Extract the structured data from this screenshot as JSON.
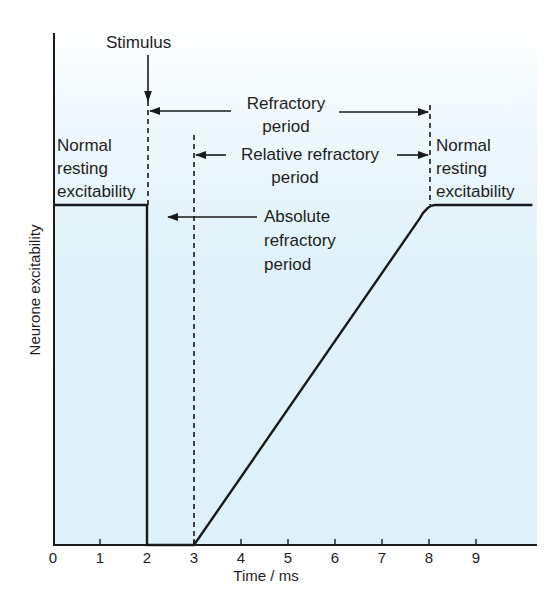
{
  "chart_data": {
    "type": "line",
    "title": "",
    "xlabel": "Time / ms",
    "ylabel": "Neurone excitability",
    "xlim": [
      0,
      10.3
    ],
    "ylim": [
      0,
      1
    ],
    "grid": false,
    "x_ticks": [
      0,
      1,
      2,
      3,
      4,
      5,
      6,
      7,
      8,
      9
    ],
    "x_tick_labels": [
      "0",
      "1",
      "2",
      "3",
      "4",
      "5",
      "6",
      "7",
      "8",
      "9"
    ],
    "y_ticks": [],
    "series": [
      {
        "name": "Neurone excitability",
        "x": [
          0,
          2,
          2,
          3,
          7.8,
          8.0,
          10.2
        ],
        "y": [
          1,
          1,
          0,
          0,
          0.96,
          1,
          1
        ]
      }
    ],
    "markers": [
      {
        "name": "stimulus",
        "x": 2,
        "style": "dashed"
      },
      {
        "name": "relative-start",
        "x": 3,
        "style": "dashed"
      },
      {
        "name": "refractory-end",
        "x": 8,
        "style": "dashed"
      }
    ],
    "annotations": [
      {
        "id": "stimulus",
        "text": "Stimulus",
        "points_to_x": 2
      },
      {
        "id": "refractory",
        "text": [
          "Refractory",
          "period"
        ],
        "span_x": [
          2,
          8
        ]
      },
      {
        "id": "relative",
        "text": [
          "Relative refractory",
          "period"
        ],
        "span_x": [
          3,
          8
        ]
      },
      {
        "id": "absolute",
        "text": [
          "Absolute",
          "refractory",
          "period"
        ],
        "span_x": [
          2,
          3
        ]
      },
      {
        "id": "normal_left",
        "text": [
          "Normal",
          "resting",
          "excitability"
        ],
        "span_x": [
          0,
          2
        ]
      },
      {
        "id": "normal_right",
        "text": [
          "Normal",
          "resting",
          "excitability"
        ],
        "span_x": [
          8,
          10.2
        ]
      }
    ]
  },
  "labels": {
    "stimulus": "Stimulus",
    "refractory_1": "Refractory",
    "refractory_2": "period",
    "relative_1": "Relative refractory",
    "relative_2": "period",
    "absolute_1": "Absolute",
    "absolute_2": "refractory",
    "absolute_3": "period",
    "normal_left_1": "Normal",
    "normal_left_2": "resting",
    "normal_left_3": "excitability",
    "normal_right_1": "Normal",
    "normal_right_2": "resting",
    "normal_right_3": "excitability",
    "xlabel": "Time / ms",
    "ylabel": "Neurone excitability"
  },
  "colors": {
    "panel": "#dff2f9",
    "line": "#1a1a1a"
  }
}
